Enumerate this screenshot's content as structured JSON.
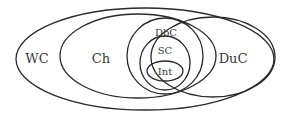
{
  "diagram": {
    "type": "venn",
    "stroke_color": "#2a2a2a",
    "sets": [
      {
        "id": "wc",
        "label": "WC",
        "cx": 145,
        "cy": 59,
        "rx": 129,
        "ry": 51,
        "label_x": 37,
        "label_y": 63,
        "font_size": 13
      },
      {
        "id": "ch",
        "label": "Ch",
        "cx": 138,
        "cy": 56,
        "rx": 78,
        "ry": 42,
        "label_x": 101,
        "label_y": 63,
        "font_size": 13
      },
      {
        "id": "duc",
        "label": "DuC",
        "cx": 213,
        "cy": 57,
        "rx": 62,
        "ry": 40,
        "label_x": 233,
        "label_y": 63,
        "font_size": 13
      },
      {
        "id": "dbc",
        "label": "DbC",
        "cx": 165,
        "cy": 56,
        "rx": 38,
        "ry": 38,
        "label_x": 166,
        "label_y": 36,
        "font_size": 10
      },
      {
        "id": "sc",
        "label": "SC",
        "cx": 165,
        "cy": 63,
        "rx": 25,
        "ry": 27,
        "label_x": 165,
        "label_y": 54,
        "font_size": 10
      },
      {
        "id": "int",
        "label": "Int",
        "cx": 165,
        "cy": 71,
        "rx": 18,
        "ry": 10,
        "label_x": 165,
        "label_y": 75,
        "font_size": 10
      }
    ]
  }
}
